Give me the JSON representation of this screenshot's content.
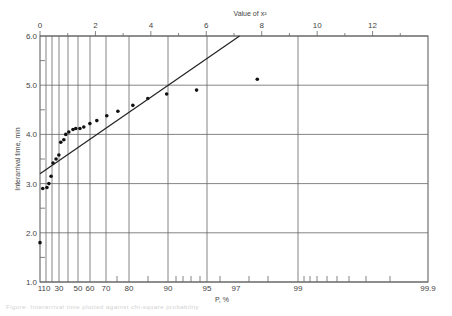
{
  "chart_data": {
    "type": "scatter",
    "title": "",
    "xlabel": "P, %",
    "x2label": "Value of x²",
    "ylabel": "Interarrival time, min",
    "ylim": [
      1.0,
      6.0
    ],
    "yticks": [
      "1.0",
      "2.0",
      "3.0",
      "4.0",
      "5.0",
      "6.0"
    ],
    "x_scale": "probability (chi-square)",
    "xticks": [
      "1",
      "10",
      "30",
      "50",
      "60",
      "70",
      "80",
      "90",
      "95",
      "97",
      "99",
      "99.9"
    ],
    "x2ticks": [
      "0",
      "2",
      "4",
      "6",
      "8",
      "10",
      "12"
    ],
    "x2lim": [
      0,
      14
    ],
    "grid": true,
    "legend": null,
    "series": [
      {
        "name": "observed",
        "kind": "points",
        "x2": [
          0.0,
          0.1,
          0.25,
          0.32,
          0.4,
          0.47,
          0.58,
          0.68,
          0.75,
          0.86,
          0.93,
          1.04,
          1.19,
          1.29,
          1.44,
          1.58,
          1.8,
          2.05,
          2.41,
          2.81,
          3.35,
          3.89,
          4.57,
          5.65,
          7.84
        ],
        "values": [
          1.8,
          2.9,
          2.92,
          3.0,
          3.15,
          3.42,
          3.5,
          3.58,
          3.84,
          3.89,
          4.0,
          4.05,
          4.1,
          4.12,
          4.12,
          4.15,
          4.22,
          4.28,
          4.38,
          4.47,
          4.59,
          4.73,
          4.82,
          4.9,
          5.12
        ]
      },
      {
        "name": "fitted line",
        "kind": "line",
        "x2": [
          0.0,
          7.2
        ],
        "values": [
          3.2,
          6.0
        ]
      }
    ]
  },
  "caption": "Figure: Interarrival time plotted against chi-square probability"
}
